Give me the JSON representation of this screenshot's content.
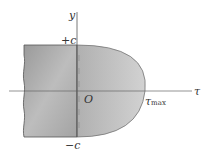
{
  "diagram": {
    "axis_labels": {
      "vertical": "y",
      "horizontal": "τ",
      "origin": "O"
    },
    "markers": {
      "top": "+c",
      "bottom": "−c",
      "peak_symbol": "τ",
      "peak_subscript": "max"
    },
    "colors": {
      "beam_fill": "#a8a8a8",
      "parabola_fill": "#c2c2c2",
      "outline": "#555555",
      "axis": "#666666"
    }
  }
}
